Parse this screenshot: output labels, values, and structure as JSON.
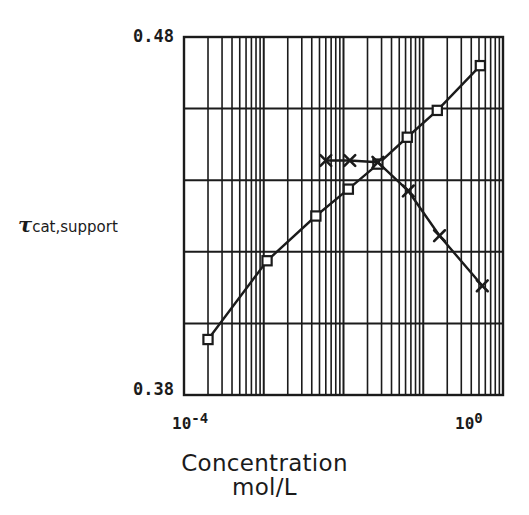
{
  "figure": {
    "kind": "scientific-plot",
    "background": "#ffffff",
    "ink_color": "#1b1b1b"
  },
  "axes": {
    "y_top_label": "0.48",
    "y_bottom_label": "0.38",
    "y_title_symbol": "τ",
    "y_title_subscript": "cat,support",
    "x_left_base": "10",
    "x_left_exponent": "-4",
    "x_right_base": "10",
    "x_right_exponent": "0",
    "x_title_line1": "Concentration",
    "x_title_line2": "mol/L"
  },
  "chart_data": {
    "type": "line",
    "title": "",
    "xlabel": "Concentration mol/L",
    "ylabel": "τ cat,support",
    "xscale": "log",
    "yscale": "linear",
    "xlim": [
      0.0001,
      1.0
    ],
    "ylim": [
      0.38,
      0.48
    ],
    "ylim_labels": [
      "0.38",
      "0.48"
    ],
    "xtick_labels": [
      "10^-4",
      "10^0"
    ],
    "y_major_gridlines": [
      0.4,
      0.42,
      0.44,
      0.46
    ],
    "x_major_gridlines": [
      0.0001,
      0.001,
      0.01,
      0.1,
      1.0
    ],
    "grid": true,
    "minor_grid": true,
    "legend": "none",
    "series": [
      {
        "name": "rising-series",
        "marker": "square",
        "values": [
          {
            "x": 0.0002,
            "y": 0.3955
          },
          {
            "x": 0.0011,
            "y": 0.4175
          },
          {
            "x": 0.0045,
            "y": 0.43
          },
          {
            "x": 0.0115,
            "y": 0.4375
          },
          {
            "x": 0.027,
            "y": 0.4445
          },
          {
            "x": 0.063,
            "y": 0.452
          },
          {
            "x": 0.15,
            "y": 0.4595
          },
          {
            "x": 0.52,
            "y": 0.472
          }
        ]
      },
      {
        "name": "falling-series",
        "marker": "x",
        "values": [
          {
            "x": 0.006,
            "y": 0.4455
          },
          {
            "x": 0.012,
            "y": 0.4455
          },
          {
            "x": 0.027,
            "y": 0.445
          },
          {
            "x": 0.065,
            "y": 0.437
          },
          {
            "x": 0.16,
            "y": 0.4245
          },
          {
            "x": 0.55,
            "y": 0.4105
          }
        ]
      }
    ]
  }
}
